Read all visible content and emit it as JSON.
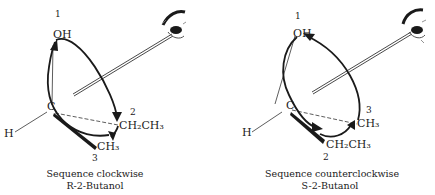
{
  "panels": [
    {
      "id": "r-2-butanol",
      "priority_1": "1",
      "priority_2": "2",
      "priority_3": "3",
      "oh": "OH",
      "c": "C",
      "h": "H",
      "group_2": "CH₂CH₃",
      "group_3": "CH₃",
      "caption_line1": "Sequence clockwise",
      "caption_line2": "R-2-Butanol",
      "direction": "clockwise"
    },
    {
      "id": "s-2-butanol",
      "priority_1": "1",
      "priority_2": "2",
      "priority_3": "3",
      "oh": "OH",
      "c": "C",
      "h": "H",
      "group_2": "CH₂CH₃",
      "group_3": "CH₃",
      "caption_line1": "Sequence counterclockwise",
      "caption_line2": "S-2-Butanol",
      "direction": "counterclockwise"
    }
  ],
  "colors": {
    "ink": "#1a1a1a",
    "background": "#ffffff"
  }
}
